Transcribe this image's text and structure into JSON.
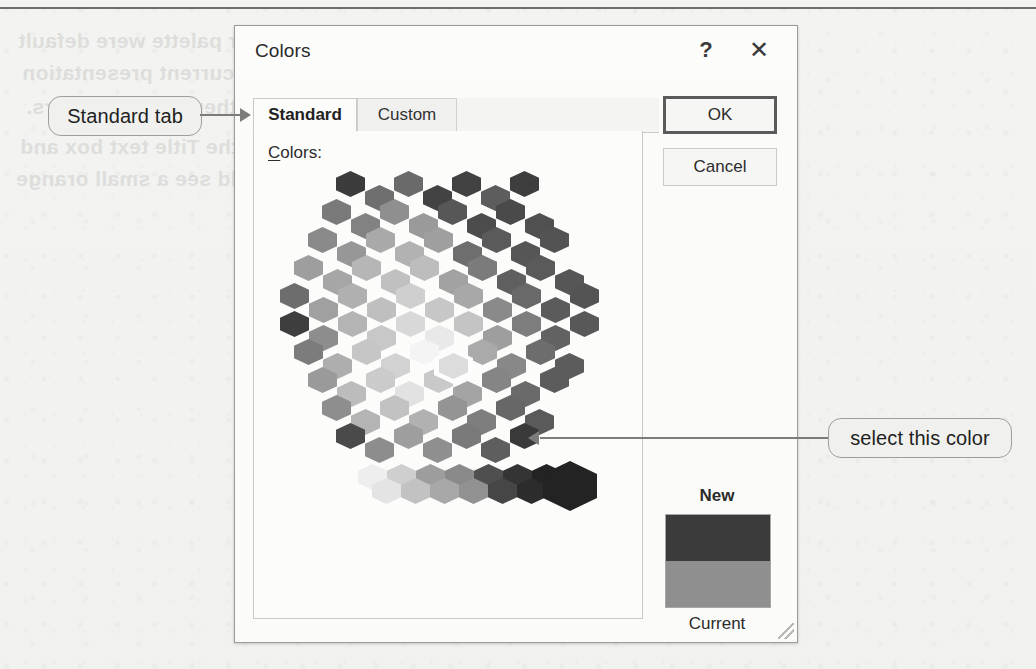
{
  "dialog": {
    "title": "Colors",
    "help_icon": "?",
    "close_icon": "✕",
    "tabs": [
      {
        "label": "Standard",
        "active": true
      },
      {
        "label": "Custom",
        "active": false
      }
    ],
    "colors_label_accel": "C",
    "colors_label_rest": "olors:",
    "buttons": {
      "ok": "OK",
      "cancel": "Cancel"
    },
    "preview": {
      "new_label": "New",
      "current_label": "Current",
      "new_color": "#3b3b3b",
      "current_color": "#8f8f8f"
    }
  },
  "annotations": [
    {
      "id": "standard-tab",
      "text": "Standard tab"
    },
    {
      "id": "select-color",
      "text": "select this color"
    }
  ],
  "ghost_text": [
    "a theme's color palette were default",
    "be part of the current presentation",
    "theme based colors.",
    "lick in the Title text box and",
    "and you should see a small orange"
  ],
  "palette": {
    "selected_index": 61,
    "honeycomb_rows": [
      {
        "offset": 112,
        "colors": [
          "#3b3b3b",
          "#6f6f6f",
          "#6a6a6a",
          "#434343",
          "#414141",
          "#5d5d5d",
          "#3e3e3e"
        ]
      },
      {
        "offset": 84,
        "colors": [
          "#7a7a7a",
          "#828282",
          "#8f8f8f",
          "#9a9a9a",
          "#575757",
          "#4c4c4c",
          "#4a4a4a",
          "#505050"
        ]
      },
      {
        "offset": 56,
        "colors": [
          "#8a8a8a",
          "#979797",
          "#a9a9a9",
          "#b2b2b2",
          "#9f9f9f",
          "#6e6e6e",
          "#5a5a5a",
          "#565656",
          "#535353"
        ]
      },
      {
        "offset": 28,
        "colors": [
          "#9e9e9e",
          "#a6a6a6",
          "#b6b6b6",
          "#c0c0c0",
          "#bdbdbd",
          "#a2a2a2",
          "#7b7b7b",
          "#5f5f5f",
          "#5a5a5a",
          "#565656"
        ]
      },
      {
        "offset": 0,
        "colors": [
          "#6d6d6d",
          "#a0a0a0",
          "#b0b0b0",
          "#bfbfbf",
          "#cfcfcf",
          "#c7c7c7",
          "#a8a8a8",
          "#8a8a8a",
          "#696969",
          "#5b5b5b",
          "#545454"
        ]
      },
      {
        "offset": 0,
        "colors": [
          "#3e3e3e",
          "#8d8d8d",
          "#b4b4b4",
          "#c8c8c8",
          "#d8d8d8",
          "#e9e9e9",
          "#c4c4c4",
          "#9e9e9e",
          "#7d7d7d",
          "#626262",
          "#585858"
        ]
      },
      {
        "offset": 28,
        "colors": [
          "#7c7c7c",
          "#aeaeae",
          "#c6c6c6",
          "#d2d2d2",
          "#f4f4f4",
          "#dcdcdc",
          "#aaaaaa",
          "#888888",
          "#6d6d6d",
          "#5c5c5c"
        ]
      },
      {
        "offset": 56,
        "colors": [
          "#9a9a9a",
          "#bcbcbc",
          "#cbcbcb",
          "#e2e2e2",
          "#c9c9c9",
          "#a4a4a4",
          "#858585",
          "#6a6a6a",
          "#5c5c5c"
        ]
      },
      {
        "offset": 84,
        "colors": [
          "#8e8e8e",
          "#b4b4b4",
          "#c2c2c2",
          "#b1b1b1",
          "#949494",
          "#7e7e7e",
          "#676767",
          "#5a5a5a"
        ]
      },
      {
        "offset": 112,
        "colors": [
          "#4a4a4a",
          "#8d8d8d",
          "#9e9e9e",
          "#8f8f8f",
          "#7a7a7a",
          "#5e5e5e",
          "#3a3a3a"
        ]
      }
    ],
    "gray_ramp_top": [
      "#eeeeee",
      "#cfcfcf",
      "#9d9d9d",
      "#8a8a8a",
      "#4f4f4f",
      "#343434",
      "#232323"
    ],
    "gray_ramp_bottom": [
      "#e4e4e4",
      "#c2c2c2",
      "#a8a8a8",
      "#919191",
      "#464646",
      "#2c2c2c"
    ],
    "big_swatch": "#232323"
  }
}
